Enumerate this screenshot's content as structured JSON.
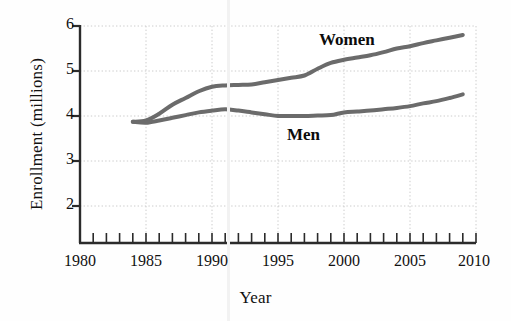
{
  "chart_data": {
    "type": "line",
    "title": "",
    "xlabel": "Year",
    "ylabel": "Enrollment (millions)",
    "xlim": [
      1980,
      2010
    ],
    "ylim": [
      1.3,
      6
    ],
    "xticks": [
      1980,
      1985,
      1990,
      1995,
      2000,
      2005,
      2010
    ],
    "xtick_labels": [
      "1980",
      "1985",
      "1990",
      "1995",
      "2000",
      "2005",
      "2010"
    ],
    "x_minor_tick_step": 1,
    "yticks": [
      2,
      3,
      4,
      5,
      6
    ],
    "ytick_labels": [
      "2",
      "3",
      "4",
      "5",
      "6"
    ],
    "grid": "dotted light gray, both axes",
    "legend_position": "inline annotations on plot",
    "line_color": "#6b6b6b",
    "line_width_px": 4,
    "x": [
      1984,
      1985,
      1986,
      1987,
      1988,
      1989,
      1990,
      1991,
      1992,
      1993,
      1994,
      1995,
      1996,
      1997,
      1998,
      1999,
      2000,
      2001,
      2002,
      2003,
      2004,
      2005,
      2006,
      2007,
      2008,
      2009
    ],
    "series": [
      {
        "name": "Women",
        "label": "Women",
        "values": [
          3.87,
          3.9,
          4.05,
          4.25,
          4.4,
          4.55,
          4.65,
          4.68,
          4.69,
          4.7,
          4.75,
          4.8,
          4.85,
          4.9,
          5.05,
          5.18,
          5.25,
          5.3,
          5.35,
          5.42,
          5.5,
          5.55,
          5.62,
          5.68,
          5.74,
          5.8
        ]
      },
      {
        "name": "Men",
        "label": "Men",
        "values": [
          3.87,
          3.85,
          3.9,
          3.96,
          4.02,
          4.08,
          4.12,
          4.15,
          4.12,
          4.08,
          4.04,
          4.0,
          4.0,
          4.0,
          4.01,
          4.02,
          4.08,
          4.1,
          4.12,
          4.15,
          4.18,
          4.22,
          4.28,
          4.33,
          4.4,
          4.48
        ]
      }
    ]
  },
  "figure": {
    "y_axis_title": "Enrollment (millions)",
    "x_axis_title": "Year",
    "women_label": "Women",
    "men_label": "Men",
    "x_tick_labels": [
      "1980",
      "1985",
      "1990",
      "1995",
      "2000",
      "2005",
      "2010"
    ],
    "y_tick_labels": [
      "6",
      "5",
      "4",
      "3",
      "2"
    ],
    "accent_color": "#6b6b6b",
    "grid_color": "#cfcfcf",
    "axis_color": "#2b2b2b"
  }
}
